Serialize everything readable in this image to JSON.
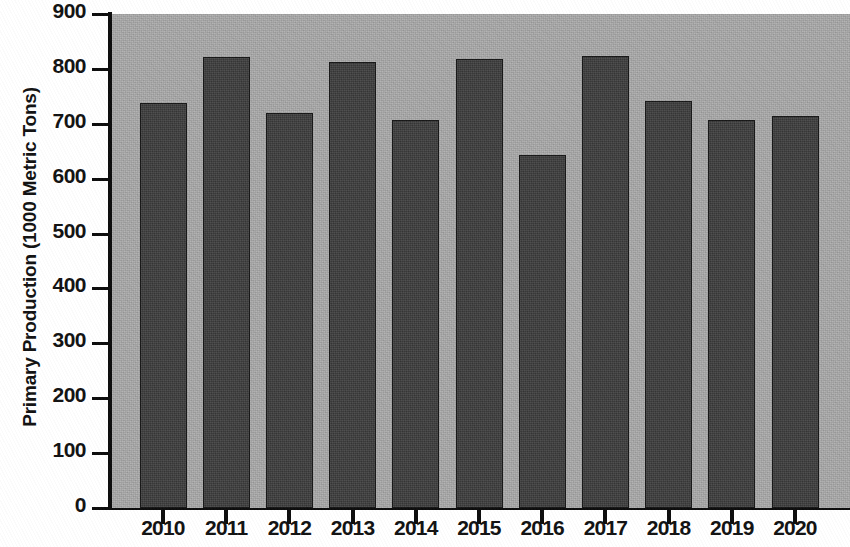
{
  "chart_data": {
    "type": "bar",
    "title": "",
    "xlabel": "",
    "ylabel": "Primary Production (1000 Metric Tons)",
    "categories": [
      "2010",
      "2011",
      "2012",
      "2013",
      "2014",
      "2015",
      "2016",
      "2017",
      "2018",
      "2019",
      "2020"
    ],
    "values": [
      738,
      822,
      720,
      813,
      707,
      818,
      643,
      823,
      741,
      707,
      714
    ],
    "series": [
      {
        "name": "Primary Production",
        "values": [
          738,
          822,
          720,
          813,
          707,
          818,
          643,
          823,
          741,
          707,
          714
        ]
      }
    ],
    "ylim": [
      0,
      900
    ],
    "y_ticks": [
      0,
      100,
      200,
      300,
      400,
      500,
      600,
      700,
      800,
      900
    ],
    "y_tick_labels": [
      "0",
      "100",
      "200",
      "300",
      "400",
      "500",
      "600",
      "700",
      "800",
      "900"
    ],
    "grid": false,
    "legend": false,
    "legend_position": "none",
    "bar_color": "#3b3b3b",
    "bar_edge_color": "#161616",
    "plot_background_color": "#a9a9a9",
    "figure_background_color": "#ffffff",
    "axis_color": "#0b0b0b",
    "text_color": "#111111"
  },
  "axes": {
    "y_title": "Primary Production (1000 Metric Tons)"
  }
}
